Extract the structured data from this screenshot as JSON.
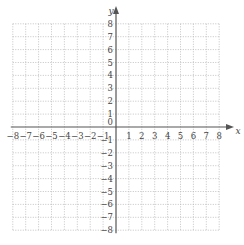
{
  "diagram": {
    "type": "coordinate-plane",
    "x_axis": {
      "label": "x",
      "min": -8,
      "max": 8,
      "step": 1,
      "tick_labels": [
        "-8",
        "-7",
        "-6",
        "-5",
        "-4",
        "-3",
        "-2",
        "-1",
        "1",
        "2",
        "3",
        "4",
        "5",
        "6",
        "7",
        "8"
      ]
    },
    "y_axis": {
      "label": "y",
      "min": -8,
      "max": 8,
      "step": 1,
      "tick_labels": [
        "8",
        "7",
        "6",
        "5",
        "4",
        "3",
        "2",
        "1",
        "-1",
        "-2",
        "-3",
        "-4",
        "-5",
        "-6",
        "-7",
        "-8"
      ]
    },
    "origin_label": "0",
    "grid": "dotted",
    "colors": {
      "axis": "#555555",
      "grid": "#b5b5b5",
      "text": "#444444"
    }
  }
}
